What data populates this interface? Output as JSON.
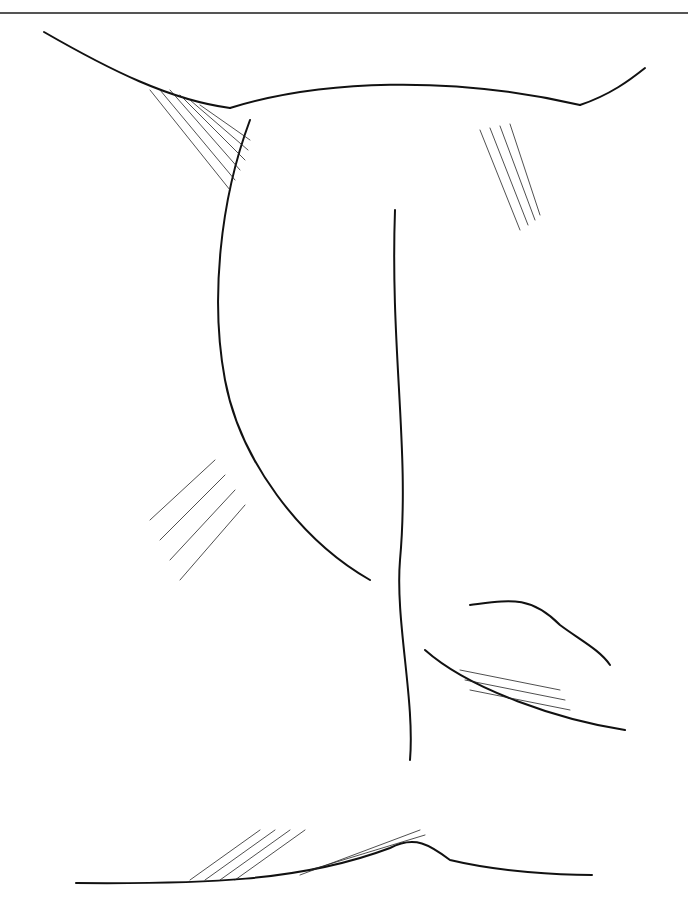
{
  "figure": {
    "type": "line-art illustration",
    "style": "black ink on white, hatched shading",
    "colors": {
      "ink": "#111111",
      "background": "#ffffff",
      "rule": "#555555"
    },
    "labels": []
  }
}
